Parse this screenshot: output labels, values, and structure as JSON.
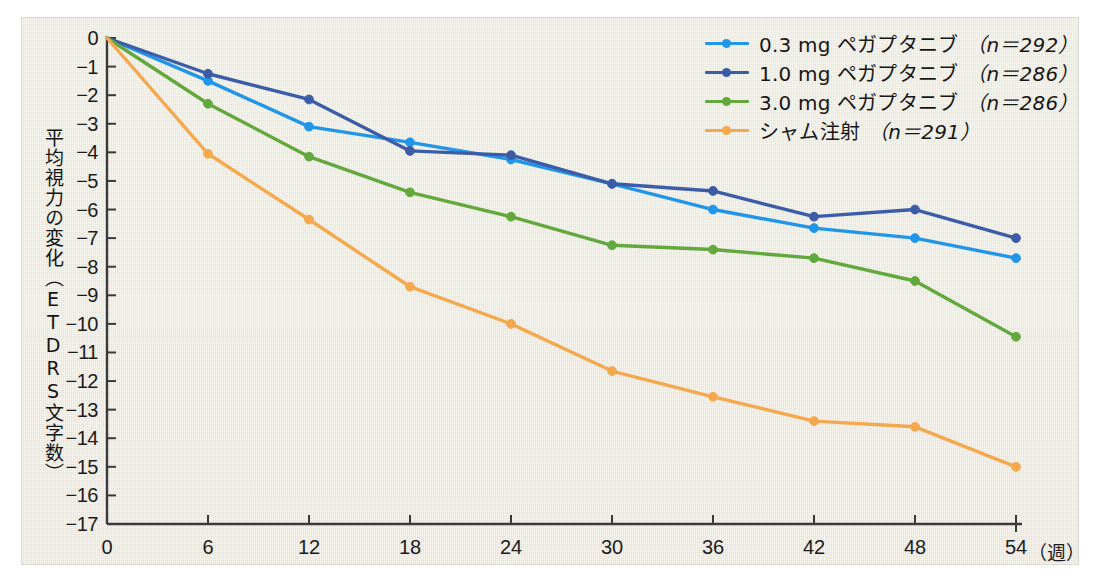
{
  "chart_data": {
    "type": "line",
    "title": "",
    "xlabel": "週",
    "ylabel": "平均視力の変化（ETDRS文字数）",
    "x": [
      0,
      6,
      12,
      18,
      24,
      30,
      36,
      42,
      48,
      54
    ],
    "xticklabels": [
      "0",
      "6",
      "12",
      "18",
      "24",
      "30",
      "36",
      "42",
      "48",
      "54"
    ],
    "x_unit_label": "（週）",
    "xlim": [
      0,
      54
    ],
    "ylim": [
      -17,
      0
    ],
    "yticks": [
      0,
      -1,
      -2,
      -3,
      -4,
      -5,
      -6,
      -7,
      -8,
      -9,
      -10,
      -11,
      -12,
      -13,
      -14,
      -15,
      -16,
      -17
    ],
    "yticklabels": [
      "0",
      "−1",
      "−2",
      "−3",
      "−4",
      "−5",
      "−6",
      "−7",
      "−8",
      "−9",
      "−10",
      "−11",
      "−12",
      "−13",
      "−14",
      "−15",
      "−16",
      "−17"
    ],
    "grid": false,
    "legend_position": "top-right",
    "series": [
      {
        "name": "0.3 mg ペガプタニブ",
        "label_dose": "0.3 mg ペガプタニブ",
        "label_n": "（n＝292）",
        "n": 292,
        "color": "#2196e8",
        "values": [
          0,
          -1.5,
          -3.1,
          -3.65,
          -4.25,
          -5.1,
          -6.0,
          -6.65,
          -7.0,
          -7.7
        ]
      },
      {
        "name": "1.0 mg ペガプタニブ",
        "label_dose": "1.0 mg ペガプタニブ",
        "label_n": "（n＝286）",
        "n": 286,
        "color": "#3c5ca8",
        "values": [
          0,
          -1.25,
          -2.15,
          -3.95,
          -4.1,
          -5.1,
          -5.35,
          -6.25,
          -6.0,
          -7.0
        ]
      },
      {
        "name": "3.0 mg ペガプタニブ",
        "label_dose": "3.0 mg ペガプタニブ",
        "label_n": "（n＝286）",
        "n": 286,
        "color": "#63a83c",
        "values": [
          0,
          -2.3,
          -4.15,
          -5.4,
          -6.25,
          -7.25,
          -7.4,
          -7.7,
          -8.5,
          -10.45
        ]
      },
      {
        "name": "シャム注射",
        "label_dose": "シャム注射",
        "label_n": "（n＝291）",
        "n": 291,
        "color": "#f5a94e",
        "values": [
          0,
          -4.05,
          -6.35,
          -8.7,
          -10.0,
          -11.65,
          -12.55,
          -13.4,
          -13.6,
          -15.0
        ]
      }
    ]
  }
}
